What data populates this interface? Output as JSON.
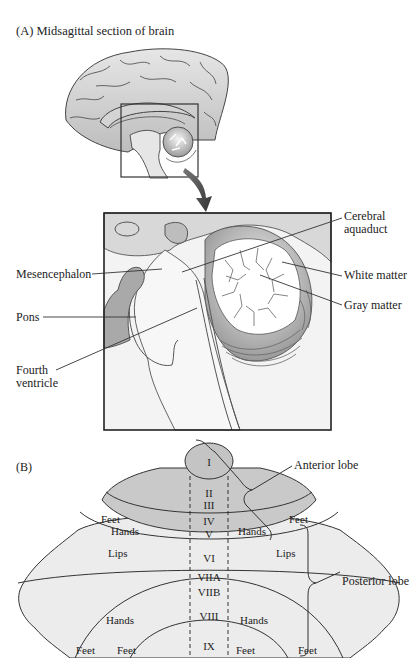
{
  "panel_a": {
    "title": "(A)  Midsagittal section of brain",
    "labels": {
      "cerebral_aquaduct": [
        "Cerebral",
        "aquaduct"
      ],
      "mesencephalon": "Mesencephalon",
      "white_matter": "White matter",
      "pons": "Pons",
      "gray_matter": "Gray matter",
      "fourth_ventricle": [
        "Fourth",
        "ventricle"
      ]
    }
  },
  "panel_b": {
    "title": "(B)",
    "lobes": {
      "anterior": "Anterior lobe",
      "posterior": "Posterior lobe"
    },
    "lobules": [
      "I",
      "II",
      "III",
      "IV",
      "V",
      "VI",
      "VIIA",
      "VIIB",
      "VIII",
      "IX"
    ],
    "somatotopic": {
      "feet_upper_left": "Feet",
      "feet_upper_right": "Feet",
      "hands_upper_left": "Hands",
      "hands_upper_right": "Hands",
      "lips_left": "Lips",
      "lips_right": "Lips",
      "hands_lower_left": "Hands",
      "hands_lower_right": "Hands",
      "feet_lower_outer_left": "Feet",
      "feet_lower_inner_left": "Feet",
      "feet_lower_inner_right": "Feet",
      "feet_lower_outer_right": "Feet"
    }
  },
  "colors": {
    "anterior_fill": "#c9c9c9",
    "posterior_fill": "#ececec",
    "lobule_I_fill": "#c4c4c4",
    "stroke": "#333333"
  }
}
